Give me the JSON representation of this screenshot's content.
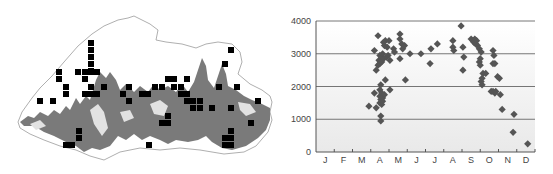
{
  "map": {
    "title": "",
    "marker_color": "#000000",
    "relief_color": "#7a7a7a",
    "border_color": "#9a9a9a",
    "markers": [
      [
        91,
        43
      ],
      [
        91,
        50
      ],
      [
        91,
        57
      ],
      [
        91,
        64
      ],
      [
        91,
        71
      ],
      [
        59,
        72
      ],
      [
        59,
        79
      ],
      [
        78,
        72
      ],
      [
        85,
        72
      ],
      [
        91,
        72
      ],
      [
        97,
        72
      ],
      [
        85,
        79
      ],
      [
        66,
        87
      ],
      [
        66,
        94
      ],
      [
        91,
        87
      ],
      [
        104,
        87
      ],
      [
        129,
        87
      ],
      [
        85,
        94
      ],
      [
        91,
        94
      ],
      [
        97,
        94
      ],
      [
        123,
        94
      ],
      [
        40,
        101
      ],
      [
        53,
        101
      ],
      [
        129,
        101
      ],
      [
        79,
        131
      ],
      [
        79,
        138
      ],
      [
        66,
        145
      ],
      [
        72,
        145
      ],
      [
        142,
        94
      ],
      [
        148,
        94
      ],
      [
        155,
        87
      ],
      [
        162,
        87
      ],
      [
        168,
        79
      ],
      [
        174,
        79
      ],
      [
        187,
        79
      ],
      [
        174,
        87
      ],
      [
        181,
        87
      ],
      [
        181,
        94
      ],
      [
        187,
        94
      ],
      [
        187,
        101
      ],
      [
        193,
        101
      ],
      [
        200,
        101
      ],
      [
        193,
        108
      ],
      [
        200,
        108
      ],
      [
        212,
        108
      ],
      [
        168,
        116
      ],
      [
        162,
        123
      ],
      [
        168,
        123
      ],
      [
        149,
        145
      ],
      [
        231,
        50
      ],
      [
        225,
        64
      ],
      [
        219,
        87
      ],
      [
        237,
        87
      ],
      [
        258,
        101
      ],
      [
        231,
        108
      ],
      [
        251,
        123
      ],
      [
        231,
        131
      ],
      [
        225,
        138
      ],
      [
        231,
        138
      ],
      [
        225,
        145
      ],
      [
        231,
        145
      ]
    ]
  },
  "chart_data": {
    "type": "scatter",
    "title": "",
    "xlabel": "",
    "ylabel": "",
    "categories": [
      "J",
      "F",
      "M",
      "A",
      "M",
      "J",
      "J",
      "A",
      "S",
      "O",
      "N",
      "D"
    ],
    "ylim": [
      0,
      4000
    ],
    "yticks": [
      0,
      1000,
      2000,
      3000,
      4000
    ],
    "grid": true,
    "legend": null,
    "marker": "diamond",
    "marker_color": "#555555",
    "points": [
      {
        "month": 2.4,
        "elev": 1400
      },
      {
        "month": 2.8,
        "elev": 1350
      },
      {
        "month": 2.7,
        "elev": 1800
      },
      {
        "month": 2.7,
        "elev": 3100
      },
      {
        "month": 2.8,
        "elev": 2500
      },
      {
        "month": 2.9,
        "elev": 3550
      },
      {
        "month": 2.9,
        "elev": 2650
      },
      {
        "month": 2.95,
        "elev": 2800
      },
      {
        "month": 3.0,
        "elev": 2950
      },
      {
        "month": 3.0,
        "elev": 2700
      },
      {
        "month": 3.0,
        "elev": 1500
      },
      {
        "month": 3.0,
        "elev": 1700
      },
      {
        "month": 3.0,
        "elev": 1900
      },
      {
        "month": 3.05,
        "elev": 1100
      },
      {
        "month": 3.05,
        "elev": 950
      },
      {
        "month": 3.05,
        "elev": 2050
      },
      {
        "month": 3.05,
        "elev": 1600
      },
      {
        "month": 3.1,
        "elev": 1800
      },
      {
        "month": 3.1,
        "elev": 1450
      },
      {
        "month": 3.1,
        "elev": 2900
      },
      {
        "month": 3.1,
        "elev": 2750
      },
      {
        "month": 3.15,
        "elev": 1650
      },
      {
        "month": 3.15,
        "elev": 1550
      },
      {
        "month": 3.15,
        "elev": 3000
      },
      {
        "month": 3.2,
        "elev": 3350
      },
      {
        "month": 3.2,
        "elev": 2850
      },
      {
        "month": 3.25,
        "elev": 1750
      },
      {
        "month": 3.25,
        "elev": 3250
      },
      {
        "month": 3.3,
        "elev": 2200
      },
      {
        "month": 3.3,
        "elev": 3400
      },
      {
        "month": 3.35,
        "elev": 2900
      },
      {
        "month": 3.4,
        "elev": 3200
      },
      {
        "month": 3.45,
        "elev": 2950
      },
      {
        "month": 3.5,
        "elev": 3400
      },
      {
        "month": 3.55,
        "elev": 2800
      },
      {
        "month": 3.55,
        "elev": 1900
      },
      {
        "month": 3.75,
        "elev": 3150
      },
      {
        "month": 3.8,
        "elev": 3050
      },
      {
        "month": 4.1,
        "elev": 3600
      },
      {
        "month": 4.1,
        "elev": 3450
      },
      {
        "month": 4.1,
        "elev": 2850
      },
      {
        "month": 4.2,
        "elev": 3300
      },
      {
        "month": 4.25,
        "elev": 3150
      },
      {
        "month": 4.35,
        "elev": 3250
      },
      {
        "month": 4.4,
        "elev": 2200
      },
      {
        "month": 4.65,
        "elev": 3000
      },
      {
        "month": 5.25,
        "elev": 3000
      },
      {
        "month": 5.75,
        "elev": 2700
      },
      {
        "month": 5.8,
        "elev": 3150
      },
      {
        "month": 6.15,
        "elev": 3300
      },
      {
        "month": 7.0,
        "elev": 3400
      },
      {
        "month": 7.0,
        "elev": 3200
      },
      {
        "month": 7.05,
        "elev": 3100
      },
      {
        "month": 7.45,
        "elev": 3850
      },
      {
        "month": 7.55,
        "elev": 3200
      },
      {
        "month": 7.55,
        "elev": 2500
      },
      {
        "month": 7.6,
        "elev": 2900
      },
      {
        "month": 8.0,
        "elev": 3450
      },
      {
        "month": 8.1,
        "elev": 3400
      },
      {
        "month": 8.15,
        "elev": 3350
      },
      {
        "month": 8.2,
        "elev": 3450
      },
      {
        "month": 8.25,
        "elev": 3300
      },
      {
        "month": 8.3,
        "elev": 3400
      },
      {
        "month": 8.35,
        "elev": 3250
      },
      {
        "month": 8.45,
        "elev": 3150
      },
      {
        "month": 8.5,
        "elev": 2850
      },
      {
        "month": 8.45,
        "elev": 2750
      },
      {
        "month": 8.5,
        "elev": 2650
      },
      {
        "month": 8.55,
        "elev": 3050
      },
      {
        "month": 8.55,
        "elev": 2150
      },
      {
        "month": 8.6,
        "elev": 2050
      },
      {
        "month": 8.6,
        "elev": 2250
      },
      {
        "month": 8.65,
        "elev": 2400
      },
      {
        "month": 8.8,
        "elev": 2400
      },
      {
        "month": 9.1,
        "elev": 1850
      },
      {
        "month": 9.2,
        "elev": 1850
      },
      {
        "month": 9.3,
        "elev": 1800
      },
      {
        "month": 9.35,
        "elev": 1850
      },
      {
        "month": 9.2,
        "elev": 3100
      },
      {
        "month": 9.25,
        "elev": 2950
      },
      {
        "month": 9.2,
        "elev": 2700
      },
      {
        "month": 9.3,
        "elev": 2700
      },
      {
        "month": 9.45,
        "elev": 2300
      },
      {
        "month": 9.55,
        "elev": 2250
      },
      {
        "month": 9.6,
        "elev": 1750
      },
      {
        "month": 9.7,
        "elev": 1300
      },
      {
        "month": 10.35,
        "elev": 1150
      },
      {
        "month": 10.3,
        "elev": 600
      },
      {
        "month": 11.1,
        "elev": 250
      }
    ]
  }
}
